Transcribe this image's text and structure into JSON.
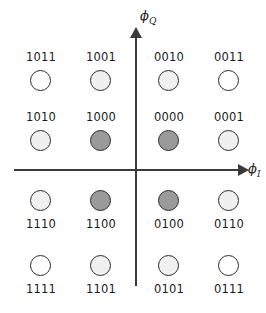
{
  "figure": {
    "type": "constellation-diagram",
    "title": "",
    "axes": {
      "horizontal": {
        "name": "phi-I",
        "symbol": "ϕ",
        "subscript": "I"
      },
      "vertical": {
        "name": "phi-Q",
        "symbol": "ϕ",
        "subscript": "Q"
      }
    },
    "colors": {
      "axis": "#3a3a3a",
      "outline": "#2b2b2b",
      "fill_none": "#ffffff",
      "fill_light": "#f0f0f0",
      "fill_medium": "#9a9a9a",
      "text": "#1a1a1a",
      "background": "#ffffff"
    },
    "points": [
      {
        "label": "1011",
        "col": 0,
        "row": 0,
        "x": 41,
        "y": 81,
        "fill": "#ffffff",
        "shade": "none",
        "label_pos": "above"
      },
      {
        "label": "1001",
        "col": 1,
        "row": 0,
        "x": 101,
        "y": 81,
        "fill": "#f0f0f0",
        "shade": "light",
        "label_pos": "above"
      },
      {
        "label": "0010",
        "col": 2,
        "row": 0,
        "x": 169,
        "y": 81,
        "fill": "#f0f0f0",
        "shade": "light",
        "label_pos": "above"
      },
      {
        "label": "0011",
        "col": 3,
        "row": 0,
        "x": 229,
        "y": 81,
        "fill": "#ffffff",
        "shade": "none",
        "label_pos": "above"
      },
      {
        "label": "1010",
        "col": 0,
        "row": 1,
        "x": 41,
        "y": 141,
        "fill": "#f0f0f0",
        "shade": "light",
        "label_pos": "above"
      },
      {
        "label": "1000",
        "col": 1,
        "row": 1,
        "x": 101,
        "y": 141,
        "fill": "#9a9a9a",
        "shade": "medium",
        "label_pos": "above"
      },
      {
        "label": "0000",
        "col": 2,
        "row": 1,
        "x": 169,
        "y": 141,
        "fill": "#9a9a9a",
        "shade": "medium",
        "label_pos": "above"
      },
      {
        "label": "0001",
        "col": 3,
        "row": 1,
        "x": 229,
        "y": 141,
        "fill": "#f0f0f0",
        "shade": "light",
        "label_pos": "above"
      },
      {
        "label": "1110",
        "col": 0,
        "row": 2,
        "x": 41,
        "y": 201,
        "fill": "#f0f0f0",
        "shade": "light",
        "label_pos": "below"
      },
      {
        "label": "1100",
        "col": 1,
        "row": 2,
        "x": 101,
        "y": 201,
        "fill": "#9a9a9a",
        "shade": "medium",
        "label_pos": "below"
      },
      {
        "label": "0100",
        "col": 2,
        "row": 2,
        "x": 169,
        "y": 201,
        "fill": "#9a9a9a",
        "shade": "medium",
        "label_pos": "below"
      },
      {
        "label": "0110",
        "col": 3,
        "row": 2,
        "x": 229,
        "y": 201,
        "fill": "#f0f0f0",
        "shade": "light",
        "label_pos": "below"
      },
      {
        "label": "1111",
        "col": 0,
        "row": 3,
        "x": 41,
        "y": 266,
        "fill": "#ffffff",
        "shade": "none",
        "label_pos": "below"
      },
      {
        "label": "1101",
        "col": 1,
        "row": 3,
        "x": 101,
        "y": 266,
        "fill": "#f0f0f0",
        "shade": "light",
        "label_pos": "below"
      },
      {
        "label": "0101",
        "col": 2,
        "row": 3,
        "x": 169,
        "y": 266,
        "fill": "#f0f0f0",
        "shade": "light",
        "label_pos": "below"
      },
      {
        "label": "0111",
        "col": 3,
        "row": 3,
        "x": 229,
        "y": 266,
        "fill": "#ffffff",
        "shade": "none",
        "label_pos": "below"
      }
    ]
  },
  "chart_data": {
    "type": "scatter",
    "title": "",
    "xlabel": "ϕ_I",
    "ylabel": "ϕ_Q",
    "grid": false,
    "legend": null,
    "xlim": [
      -2,
      2
    ],
    "ylim": [
      -2,
      2
    ],
    "series": [
      {
        "name": "constellation points",
        "point_labels": [
          "1011",
          "1001",
          "0010",
          "0011",
          "1010",
          "1000",
          "0000",
          "0001",
          "1110",
          "1100",
          "0100",
          "0110",
          "1111",
          "1101",
          "0101",
          "0111"
        ],
        "x": [
          -1.7,
          -0.7,
          0.55,
          1.55,
          -1.7,
          -0.7,
          0.55,
          1.55,
          -1.7,
          -0.7,
          0.55,
          1.55,
          -1.7,
          -0.7,
          0.55,
          1.55
        ],
        "y": [
          1.5,
          1.5,
          1.5,
          1.5,
          0.5,
          0.5,
          0.5,
          0.5,
          -0.55,
          -0.55,
          -0.55,
          -0.55,
          -1.65,
          -1.65,
          -1.65,
          -1.65
        ],
        "fills": [
          "#ffffff",
          "#f0f0f0",
          "#f0f0f0",
          "#ffffff",
          "#f0f0f0",
          "#9a9a9a",
          "#9a9a9a",
          "#f0f0f0",
          "#f0f0f0",
          "#9a9a9a",
          "#9a9a9a",
          "#f0f0f0",
          "#ffffff",
          "#f0f0f0",
          "#f0f0f0",
          "#ffffff"
        ]
      }
    ]
  }
}
